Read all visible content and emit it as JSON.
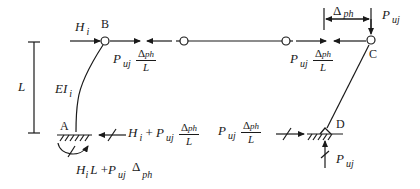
{
  "diagram": {
    "type": "structural frame free-body diagram",
    "nodes": {
      "A": "A",
      "B": "B",
      "C": "C",
      "D": "D"
    },
    "labels": {
      "height": "L",
      "stiffness": {
        "main": "EI",
        "sub": "i"
      },
      "lateral_load": {
        "main": "H",
        "sub": "i"
      },
      "axial_load_top": {
        "main": "P",
        "sub": "uj"
      },
      "axial_load_bottom": {
        "main": "P",
        "sub": "uj"
      },
      "drift": {
        "main": "Δ",
        "sub": "ph"
      },
      "pdelta_shear_B": {
        "main": "P",
        "sub": "uj",
        "num_main": "Δ",
        "num_sub": "ph",
        "den": "L"
      },
      "pdelta_shear_C": {
        "main": "P",
        "sub": "uj",
        "num_main": "Δ",
        "num_sub": "ph",
        "den": "L"
      },
      "base_shear_A": {
        "h": "H",
        "h_sub": "i",
        "plus": "+",
        "p": "P",
        "p_sub": "uj",
        "num_main": "Δ",
        "num_sub": "ph",
        "den": "L"
      },
      "base_shear_D": {
        "p": "P",
        "p_sub": "uj",
        "num_main": "Δ",
        "num_sub": "ph",
        "den": "L"
      },
      "base_moment_A": {
        "h": "H",
        "h_sub": "i",
        "l": "L",
        "plus": "+",
        "p": "P",
        "p_sub": "uj",
        "d": "Δ",
        "d_sub": "ph"
      }
    },
    "colors": {
      "ink": "#1a1a1a",
      "background": "#ffffff"
    }
  }
}
